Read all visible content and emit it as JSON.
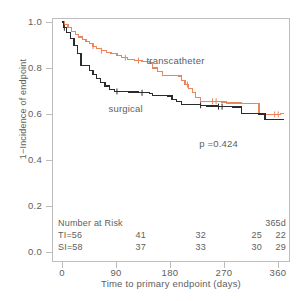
{
  "chart_data": {
    "type": "line",
    "subtype": "kaplan-meier-step",
    "title": "",
    "xlabel": "Time to primary endpoint  (days)",
    "ylabel": "1−Incidence of endpoint",
    "xlim": [
      0,
      375
    ],
    "ylim": [
      0.0,
      1.0
    ],
    "xticks": [
      0,
      90,
      180,
      270,
      360
    ],
    "xtick_labels": [
      "0",
      "90",
      "180",
      "270",
      "360"
    ],
    "yticks": [
      0.0,
      0.2,
      0.4,
      0.6,
      0.8,
      1.0
    ],
    "ytick_labels": [
      "0.0",
      "0.2",
      "0.4",
      "0.6",
      "0.8",
      "1.0"
    ],
    "grid": false,
    "legend": "inline-annotations",
    "annotations": [
      {
        "name": "p-value",
        "text": "p =0.424",
        "x": 300,
        "y": 0.47
      },
      {
        "name": "transcatheter-label",
        "text": "transcatheter",
        "x": 205,
        "y": 0.83
      },
      {
        "name": "surgical-label",
        "text": "surgical",
        "x": 108,
        "y": 0.655
      }
    ],
    "series": [
      {
        "name": "transcatheter",
        "color": "#e8875c",
        "censor_times": [
          4,
          52,
          66,
          106,
          128,
          210,
          252,
          258,
          356,
          362
        ],
        "steps": [
          [
            0,
            1.0
          ],
          [
            4,
            0.99
          ],
          [
            10,
            0.975
          ],
          [
            16,
            0.96
          ],
          [
            22,
            0.945
          ],
          [
            28,
            0.935
          ],
          [
            34,
            0.925
          ],
          [
            40,
            0.915
          ],
          [
            46,
            0.905
          ],
          [
            52,
            0.895
          ],
          [
            58,
            0.885
          ],
          [
            66,
            0.875
          ],
          [
            74,
            0.868
          ],
          [
            82,
            0.862
          ],
          [
            92,
            0.855
          ],
          [
            100,
            0.845
          ],
          [
            110,
            0.838
          ],
          [
            122,
            0.832
          ],
          [
            134,
            0.828
          ],
          [
            146,
            0.822
          ],
          [
            152,
            0.8
          ],
          [
            160,
            0.785
          ],
          [
            168,
            0.768
          ],
          [
            176,
            0.766
          ],
          [
            196,
            0.765
          ],
          [
            200,
            0.745
          ],
          [
            206,
            0.728
          ],
          [
            212,
            0.712
          ],
          [
            218,
            0.695
          ],
          [
            224,
            0.672
          ],
          [
            232,
            0.655
          ],
          [
            268,
            0.652
          ],
          [
            276,
            0.648
          ],
          [
            300,
            0.645
          ],
          [
            330,
            0.598
          ],
          [
            358,
            0.598
          ],
          [
            366,
            0.602
          ],
          [
            372,
            0.602
          ]
        ]
      },
      {
        "name": "surgical",
        "color": "#2b2b2b",
        "censor_times": [
          4,
          92,
          134,
          232,
          262,
          268
        ],
        "steps": [
          [
            0,
            1.0
          ],
          [
            2,
            0.975
          ],
          [
            8,
            0.955
          ],
          [
            14,
            0.928
          ],
          [
            20,
            0.898
          ],
          [
            26,
            0.862
          ],
          [
            32,
            0.812
          ],
          [
            40,
            0.81
          ],
          [
            46,
            0.79
          ],
          [
            52,
            0.772
          ],
          [
            58,
            0.755
          ],
          [
            64,
            0.738
          ],
          [
            72,
            0.722
          ],
          [
            80,
            0.705
          ],
          [
            88,
            0.698
          ],
          [
            112,
            0.696
          ],
          [
            128,
            0.692
          ],
          [
            146,
            0.688
          ],
          [
            152,
            0.68
          ],
          [
            176,
            0.678
          ],
          [
            184,
            0.662
          ],
          [
            192,
            0.655
          ],
          [
            200,
            0.64
          ],
          [
            232,
            0.638
          ],
          [
            242,
            0.635
          ],
          [
            262,
            0.632
          ],
          [
            286,
            0.63
          ],
          [
            300,
            0.602
          ],
          [
            330,
            0.6
          ],
          [
            340,
            0.575
          ],
          [
            372,
            0.575
          ]
        ]
      }
    ],
    "risk_table": {
      "title": "Number at Risk",
      "last_column_header": "365d",
      "columns_at": [
        0,
        90,
        180,
        270,
        360
      ],
      "rows": [
        {
          "label": "TI=56",
          "values": [
            "41",
            "32",
            "25",
            "22"
          ]
        },
        {
          "label": "SI=58",
          "values": [
            "37",
            "33",
            "30",
            "29"
          ]
        }
      ]
    }
  }
}
